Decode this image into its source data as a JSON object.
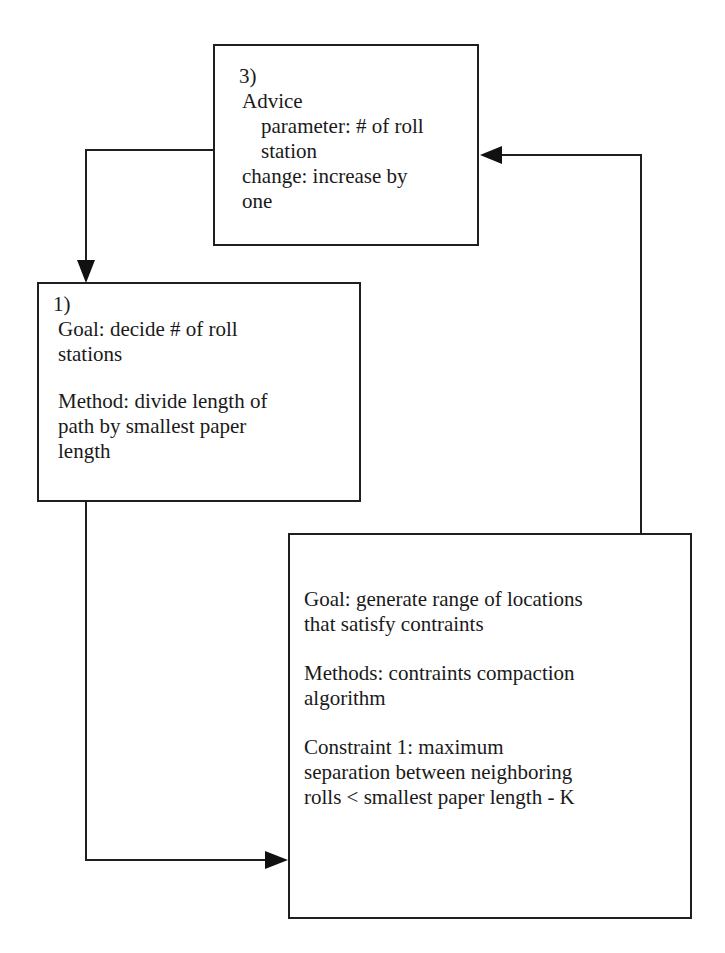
{
  "diagram": {
    "type": "flow-diagram",
    "nodes": {
      "advice": {
        "id": "3)",
        "lines": [
          {
            "text": "3)",
            "indent": "num"
          },
          {
            "text": "Advice",
            "indent": 1
          },
          {
            "text": "parameter: # of roll",
            "indent": 2
          },
          {
            "text": "station",
            "indent": 2
          },
          {
            "text": "change: increase by",
            "indent": 0
          },
          {
            "text": "one",
            "indent": 0
          }
        ]
      },
      "decide": {
        "id": "1)",
        "number": "1)",
        "goal_lines": [
          "Goal: decide # of roll",
          "stations"
        ],
        "method_lines": [
          "Method: divide length of",
          "path by smallest paper",
          "length"
        ]
      },
      "generate": {
        "goal_lines": [
          "Goal: generate range of locations",
          "that satisfy contraints"
        ],
        "method_lines": [
          "Methods: contraints compaction",
          "algorithm"
        ],
        "constraint_lines": [
          "Constraint 1: maximum",
          "separation between neighboring",
          "rolls < smallest paper length - K"
        ]
      }
    },
    "edges": [
      {
        "from": "advice",
        "to": "decide",
        "direction": "left side of 3) to top of 1)"
      },
      {
        "from": "decide",
        "to": "generate",
        "direction": "bottom of 1) to left side of generate box"
      },
      {
        "from": "generate",
        "to": "advice",
        "direction": "top of generate box to right side of 3)"
      }
    ],
    "colors": {
      "stroke": "#1f1f1f",
      "background": "#ffffff",
      "text": "#1a1a1a"
    }
  }
}
